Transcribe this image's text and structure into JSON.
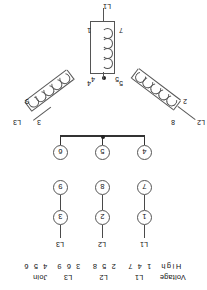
{
  "diagram": {
    "orientation": "rotated-180",
    "table": {
      "headers": [
        "Voltage",
        "L1",
        "L2",
        "L3",
        "Join"
      ],
      "rows": [
        {
          "voltage": "High",
          "l1": "1 4 7",
          "l2": "2 5 8",
          "l3": "3 6 9",
          "join": "4 5 6"
        }
      ]
    },
    "column_captions": [
      "L1",
      "L2",
      "L3"
    ],
    "terminals": {
      "row1": [
        "1",
        "2",
        "3"
      ],
      "row2": [
        "7",
        "8",
        "9"
      ],
      "row3": [
        "4",
        "5",
        "6"
      ]
    },
    "winding": {
      "phase_labels": [
        "L1",
        "L2",
        "L3"
      ],
      "coil_left": {
        "line_label": "L2",
        "start": "8",
        "end": "2",
        "neutral_end": "5"
      },
      "coil_right": {
        "line_label": "L3",
        "start": "3",
        "end": "9",
        "neutral_end": "4"
      },
      "coil_bottom": {
        "line_label": "L1",
        "top_left": "5",
        "top_right": "4",
        "bottom_left": "7",
        "bottom_right": "1"
      }
    },
    "colors": {
      "ink": "#4a4a4a",
      "node": "#222222",
      "background": "#ffffff"
    }
  }
}
